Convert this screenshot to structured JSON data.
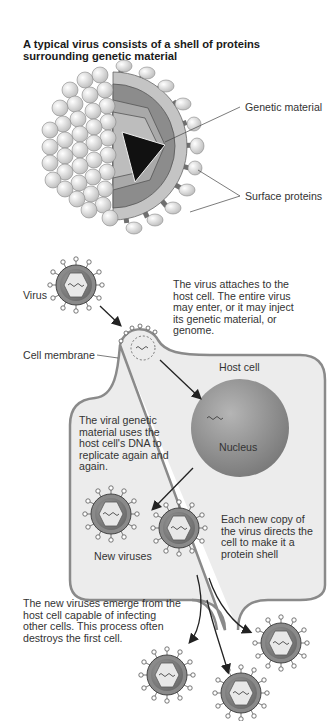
{
  "title": "A typical virus consists of a shell of proteins surrounding genetic material",
  "structure_labels": {
    "genetic_material": "Genetic material",
    "surface_proteins": "Surface proteins"
  },
  "lifecycle": {
    "labels": {
      "virus": "Virus",
      "cell_membrane": "Cell membrane",
      "host_cell": "Host cell",
      "nucleus": "Nucleus",
      "new_viruses": "New viruses"
    },
    "steps": [
      {
        "text": "The virus attaches to the host cell. The entire virus may enter, or it may inject its genetic material, or genome."
      },
      {
        "text": "The viral genetic material uses the host cell's DNA to replicate again and again."
      },
      {
        "text": "Each new copy of the virus directs the cell to make it a protein shell"
      },
      {
        "text": "The new viruses emerge from the host cell capable of infecting other cells. This process often destroys the first cell."
      }
    ]
  },
  "colors": {
    "cell_fill": "#ededed",
    "cell_outline": "#8a8a8a",
    "nucleus": "#8f8f8f",
    "capsid_dark": "#6e6e6e",
    "protein_sphere": "#e2e2e2",
    "text": "#333333"
  }
}
